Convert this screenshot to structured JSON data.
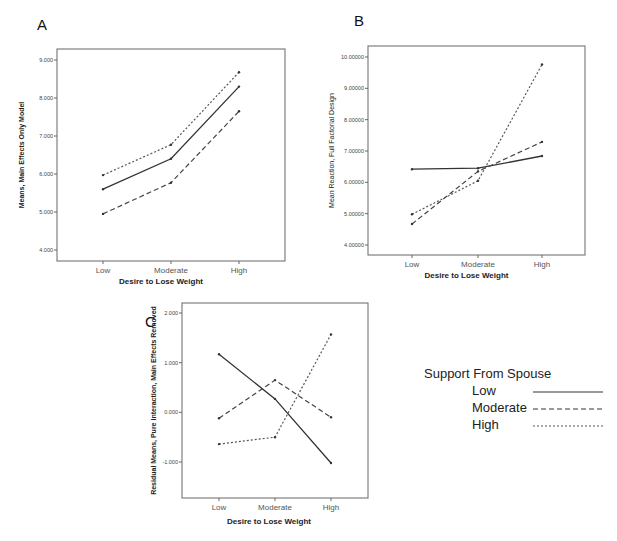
{
  "legend": {
    "title": "Support From  Spouse",
    "entries": [
      {
        "label": "Low",
        "style": "solid"
      },
      {
        "label": "Moderate",
        "style": "dashed"
      },
      {
        "label": "High",
        "style": "dotted"
      }
    ]
  },
  "chart_data": [
    {
      "panel": "A",
      "type": "line",
      "title": "",
      "xlabel": "Desire to Lose Weight",
      "ylabel": "Means, Main Effects Only Model",
      "categories": [
        "Low",
        "Moderate",
        "High"
      ],
      "yticks": [
        "4.000",
        "5.000",
        "6.000",
        "7.000",
        "8.000",
        "9.000"
      ],
      "ylim": [
        3.7,
        9.3
      ],
      "grid": false,
      "series": [
        {
          "name": "Low",
          "style": "solid",
          "values": [
            5.6,
            6.4,
            8.3
          ]
        },
        {
          "name": "Moderate",
          "style": "dashed",
          "values": [
            4.95,
            5.77,
            7.65
          ]
        },
        {
          "name": "High",
          "style": "dotted",
          "values": [
            5.97,
            6.77,
            8.68
          ]
        }
      ]
    },
    {
      "panel": "B",
      "type": "line",
      "title": "",
      "xlabel": "Desire to Lose Weight",
      "ylabel": "Mean Reaction, Full Factorial Design",
      "categories": [
        "Low",
        "Moderate",
        "High"
      ],
      "yticks": [
        "4.00000",
        "5.00000",
        "6.00000",
        "7.00000",
        "8.00000",
        "9.00000",
        "10.00000"
      ],
      "ylim": [
        3.7,
        10.35
      ],
      "grid": false,
      "series": [
        {
          "name": "Low",
          "style": "solid",
          "values": [
            6.42,
            6.45,
            6.84
          ]
        },
        {
          "name": "Moderate",
          "style": "dashed",
          "values": [
            4.67,
            6.35,
            7.29
          ]
        },
        {
          "name": "High",
          "style": "dotted",
          "values": [
            4.98,
            6.05,
            9.76
          ]
        }
      ]
    },
    {
      "panel": "C",
      "type": "line",
      "title": "",
      "xlabel": "Desire to Lose Weight",
      "ylabel": "Residual Means, Pure Interaction, Main Effects Removed",
      "categories": [
        "Low",
        "Moderate",
        "High"
      ],
      "yticks": [
        "-1.000",
        "0.000",
        "1.000",
        "2.000"
      ],
      "ylim": [
        -1.73,
        2.2
      ],
      "grid": false,
      "series": [
        {
          "name": "Low",
          "style": "solid",
          "values": [
            1.17,
            0.27,
            -1.02
          ]
        },
        {
          "name": "Moderate",
          "style": "dashed",
          "values": [
            -0.12,
            0.65,
            -0.1
          ]
        },
        {
          "name": "High",
          "style": "dotted",
          "values": [
            -0.64,
            -0.5,
            1.57
          ]
        }
      ]
    }
  ],
  "layout": {
    "panels": [
      {
        "letter": "A",
        "letter_xy": [
          37,
          30
        ],
        "frame": [
          57,
          49,
          285,
          261
        ],
        "xpos": [
          103,
          171,
          239
        ],
        "tick_y": {
          "4": 250,
          "9": 60
        },
        "ylabel_x": 24
      },
      {
        "letter": "B",
        "letter_xy": [
          354,
          26
        ],
        "frame": [
          368,
          46,
          585,
          255
        ],
        "xpos": [
          412,
          478,
          542
        ],
        "tick_y": {
          "4": 245,
          "10": 57
        },
        "ylabel_x": 334
      },
      {
        "letter": "C",
        "letter_xy": [
          145,
          327
        ],
        "frame": [
          182,
          303,
          368,
          498
        ],
        "xpos": [
          219,
          275,
          331
        ],
        "tick_y": {
          "-1": 462,
          "2": 313
        },
        "ylabel_x": 156
      }
    ]
  }
}
